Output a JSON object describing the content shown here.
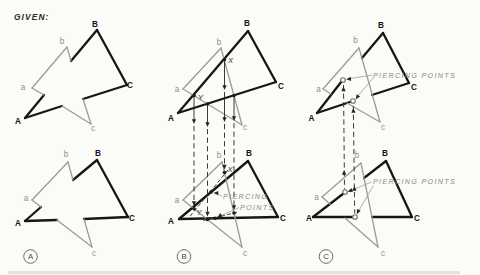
{
  "meta": {
    "width": 480,
    "height": 275,
    "background": "#fbfbf8"
  },
  "figure_title": "Piercing points of two triangles - three-view sequence",
  "labels": {
    "given": "GIVEN:",
    "piercing_points": "PIERCING POINTS",
    "piercing_line1": "PIERCING",
    "piercing_line2": "POINTS",
    "view_a": "A",
    "view_b": "B",
    "view_c": "C"
  },
  "colors": {
    "bold_triangle": "#161616",
    "light_triangle": "#9c9c96",
    "construction": "#2e2e2c",
    "callout_text": "#8a8a82"
  },
  "panels": [
    {
      "id": "a",
      "name": "panel-a-given",
      "badge": {
        "t": "A",
        "cx": 30.5,
        "cy": 256.5
      },
      "bold": [
        [
          25,
          118,
          44,
          95
        ],
        [
          71,
          61,
          97,
          30
        ],
        [
          97,
          30,
          127,
          85
        ],
        [
          83,
          99,
          127,
          85
        ],
        [
          25,
          118,
          62,
          106
        ],
        [
          25,
          221,
          41,
          207
        ],
        [
          73,
          180,
          97,
          160
        ],
        [
          97,
          160,
          128,
          217
        ],
        [
          84,
          219,
          128,
          217
        ],
        [
          25,
          221,
          57,
          220
        ]
      ],
      "gray": [
        [
          32,
          88,
          67,
          47
        ],
        [
          67,
          47,
          71,
          61
        ],
        [
          83,
          99,
          91,
          124
        ],
        [
          32,
          88,
          44,
          95
        ],
        [
          62,
          106,
          91,
          124
        ],
        [
          32,
          200,
          68,
          162
        ],
        [
          68,
          162,
          73,
          180
        ],
        [
          84,
          219,
          92,
          247
        ],
        [
          32,
          200,
          41,
          207
        ],
        [
          57,
          220,
          92,
          247
        ]
      ],
      "solid": [],
      "dash": [],
      "cut": [],
      "leaders": [],
      "dots": [],
      "rings": [],
      "arrows": [],
      "texts": [
        {
          "t": "GIVEN:",
          "x": 14,
          "y": 20,
          "c": "given",
          "a": "start"
        },
        {
          "t": "B",
          "x": 95,
          "y": 27,
          "c": "cap"
        },
        {
          "t": "C",
          "x": 130,
          "y": 88,
          "c": "cap"
        },
        {
          "t": "A",
          "x": 18,
          "y": 124,
          "c": "cap"
        },
        {
          "t": "b",
          "x": 62,
          "y": 44,
          "c": "low"
        },
        {
          "t": "a",
          "x": 23,
          "y": 90,
          "c": "low"
        },
        {
          "t": "c",
          "x": 93,
          "y": 131,
          "c": "low"
        },
        {
          "t": "B",
          "x": 98,
          "y": 156,
          "c": "cap"
        },
        {
          "t": "C",
          "x": 132,
          "y": 221,
          "c": "cap"
        },
        {
          "t": "A",
          "x": 18,
          "y": 226,
          "c": "cap"
        },
        {
          "t": "b",
          "x": 66,
          "y": 157,
          "c": "low"
        },
        {
          "t": "a",
          "x": 26,
          "y": 201,
          "c": "low"
        },
        {
          "t": "c",
          "x": 94,
          "y": 256,
          "c": "low"
        }
      ]
    },
    {
      "id": "b",
      "name": "panel-b-construction",
      "badge": {
        "t": "B",
        "cx": 184,
        "cy": 256.5
      },
      "bold": [
        [
          178,
          113,
          248,
          31
        ],
        [
          248,
          31,
          276,
          82
        ],
        [
          178,
          113,
          276,
          82
        ],
        [
          179,
          219,
          248,
          161
        ],
        [
          248,
          161,
          278,
          217
        ],
        [
          179,
          219,
          278,
          217
        ]
      ],
      "gray": [
        [
          183,
          89,
          221,
          48
        ],
        [
          221,
          48,
          242,
          125
        ],
        [
          183,
          89,
          242,
          125
        ],
        [
          183,
          200,
          222,
          162
        ],
        [
          222,
          162,
          242,
          247
        ],
        [
          183,
          200,
          242,
          247
        ]
      ],
      "solid": [
        [
          194,
          96,
          194,
          121
        ],
        [
          207.5,
          104,
          207.5,
          124
        ],
        [
          224.5,
          60,
          224.5,
          87
        ],
        [
          224.5,
          92,
          224.5,
          119
        ],
        [
          234,
          96,
          234,
          118
        ]
      ],
      "dash": [
        [
          194,
          126,
          194,
          203
        ],
        [
          207.5,
          129,
          207.5,
          213
        ],
        [
          224.5,
          124,
          224.5,
          167
        ],
        [
          234,
          123,
          234,
          207
        ]
      ],
      "cut": [
        [
          228,
          170,
          187,
          220
        ],
        [
          237,
          212.3,
          203,
          220.6
        ]
      ],
      "leaders": [
        [
          222,
          196,
          215,
          193.5
        ],
        [
          239,
          207.5,
          219.5,
          216.5
        ]
      ],
      "dots": [
        [
          194,
          95.5
        ],
        [
          207.5,
          104
        ],
        [
          224.5,
          59.5
        ],
        [
          234,
          95.5
        ],
        [
          224.5,
          172.6
        ],
        [
          194,
          208.8
        ],
        [
          207.5,
          219.5
        ],
        [
          234,
          213
        ],
        [
          211,
          192
        ],
        [
          215,
          218.2
        ]
      ],
      "rings": [],
      "arrows": [
        [
          194,
          124,
          180
        ],
        [
          194,
          206,
          180
        ],
        [
          207.5,
          127,
          180
        ],
        [
          207.5,
          216.5,
          180
        ],
        [
          224.5,
          90,
          180
        ],
        [
          224.5,
          122,
          180
        ],
        [
          224.5,
          169.5,
          180
        ],
        [
          234,
          121,
          180
        ],
        [
          234,
          210,
          180
        ],
        [
          213.5,
          193,
          270
        ],
        [
          217.5,
          217.5,
          235
        ]
      ],
      "texts": [
        {
          "t": "B",
          "x": 247,
          "y": 26,
          "c": "cap"
        },
        {
          "t": "C",
          "x": 281,
          "y": 89,
          "c": "cap"
        },
        {
          "t": "A",
          "x": 171,
          "y": 121,
          "c": "cap"
        },
        {
          "t": "b",
          "x": 219,
          "y": 45,
          "c": "low"
        },
        {
          "t": "a",
          "x": 177,
          "y": 92,
          "c": "low"
        },
        {
          "t": "c",
          "x": 245,
          "y": 130,
          "c": "low"
        },
        {
          "t": "X",
          "x": 230.5,
          "y": 63,
          "c": "xy"
        },
        {
          "t": "Y",
          "x": 200.5,
          "y": 100,
          "c": "xy"
        },
        {
          "t": "B",
          "x": 249,
          "y": 156,
          "c": "cap"
        },
        {
          "t": "C",
          "x": 283,
          "y": 221,
          "c": "cap"
        },
        {
          "t": "A",
          "x": 171,
          "y": 224,
          "c": "cap"
        },
        {
          "t": "b",
          "x": 219,
          "y": 158,
          "c": "low"
        },
        {
          "t": "a",
          "x": 177,
          "y": 203,
          "c": "low"
        },
        {
          "t": "c",
          "x": 245,
          "y": 256,
          "c": "low"
        },
        {
          "t": "X",
          "x": 230,
          "y": 172,
          "c": "xy"
        },
        {
          "t": "Y",
          "x": 199,
          "y": 215,
          "c": "xy"
        },
        {
          "t": "PIERCING",
          "x": 223,
          "y": 199,
          "c": "note",
          "a": "start"
        },
        {
          "t": "POINTS",
          "x": 240,
          "y": 210,
          "c": "note",
          "a": "start"
        }
      ]
    },
    {
      "id": "c",
      "name": "panel-c-result",
      "badge": {
        "t": "C",
        "cx": 326,
        "cy": 256.5
      },
      "bold": [
        [
          317,
          113,
          341.5,
          81.5
        ],
        [
          362,
          58,
          383,
          33
        ],
        [
          383,
          33,
          409,
          83
        ],
        [
          317,
          113,
          351.5,
          101.5
        ],
        [
          372,
          95,
          409,
          83
        ],
        [
          313,
          217,
          343.5,
          193.5
        ],
        [
          364,
          178,
          386,
          161
        ],
        [
          386,
          161,
          412,
          217
        ],
        [
          313,
          217,
          352.8,
          217
        ],
        [
          372,
          217,
          412,
          217
        ]
      ],
      "gray": [
        [
          323,
          89,
          359,
          48
        ],
        [
          359,
          48,
          380,
          122
        ],
        [
          323,
          89,
          331,
          94
        ],
        [
          347,
          103,
          380,
          122
        ],
        [
          322,
          197,
          361,
          163
        ],
        [
          361,
          163,
          378,
          247
        ],
        [
          322,
          197,
          330,
          204
        ],
        [
          345,
          218,
          378,
          247
        ]
      ],
      "solid": [],
      "dash": [
        [
          343.5,
          85,
          344.5,
          189
        ],
        [
          353.3,
          106,
          354.7,
          213.5
        ]
      ],
      "cut": [],
      "leaders": [
        [
          372,
          75,
          348,
          79
        ],
        [
          373.5,
          77.5,
          356.5,
          97.5
        ],
        [
          371.5,
          182,
          350,
          191
        ],
        [
          373.5,
          185.5,
          358,
          212
        ]
      ],
      "dots": [],
      "rings": [
        [
          343,
          80
        ],
        [
          353,
          101
        ],
        [
          345,
          192
        ],
        [
          355,
          217
        ]
      ],
      "arrows": [
        [
          343.5,
          86.5,
          0
        ],
        [
          344.1,
          170,
          0
        ],
        [
          353.4,
          108,
          0
        ],
        [
          354.4,
          186,
          0
        ],
        [
          346.2,
          79.3,
          265
        ],
        [
          355.7,
          99.3,
          215
        ],
        [
          347.8,
          192,
          245
        ],
        [
          356.8,
          214.2,
          205
        ]
      ],
      "texts": [
        {
          "t": "B",
          "x": 381,
          "y": 28,
          "c": "cap"
        },
        {
          "t": "C",
          "x": 414,
          "y": 90,
          "c": "cap"
        },
        {
          "t": "A",
          "x": 311.5,
          "y": 121,
          "c": "cap"
        },
        {
          "t": "b",
          "x": 355.5,
          "y": 43,
          "c": "low"
        },
        {
          "t": "a",
          "x": 318.5,
          "y": 92,
          "c": "low"
        },
        {
          "t": "c",
          "x": 383,
          "y": 130,
          "c": "low"
        },
        {
          "t": "B",
          "x": 385,
          "y": 156,
          "c": "cap"
        },
        {
          "t": "C",
          "x": 417,
          "y": 221,
          "c": "cap"
        },
        {
          "t": "A",
          "x": 309,
          "y": 221,
          "c": "cap"
        },
        {
          "t": "b",
          "x": 357,
          "y": 158,
          "c": "low"
        },
        {
          "t": "a",
          "x": 316.5,
          "y": 200,
          "c": "low"
        },
        {
          "t": "c",
          "x": 383,
          "y": 256,
          "c": "low"
        },
        {
          "t": "PIERCING POINTS",
          "x": 373,
          "y": 78,
          "c": "note",
          "a": "start"
        },
        {
          "t": "PIERCING POINTS",
          "x": 373,
          "y": 184,
          "c": "note",
          "a": "start"
        }
      ]
    }
  ],
  "artifact_band": {
    "x": 8,
    "y": 271,
    "w": 452,
    "h": 3.2
  }
}
